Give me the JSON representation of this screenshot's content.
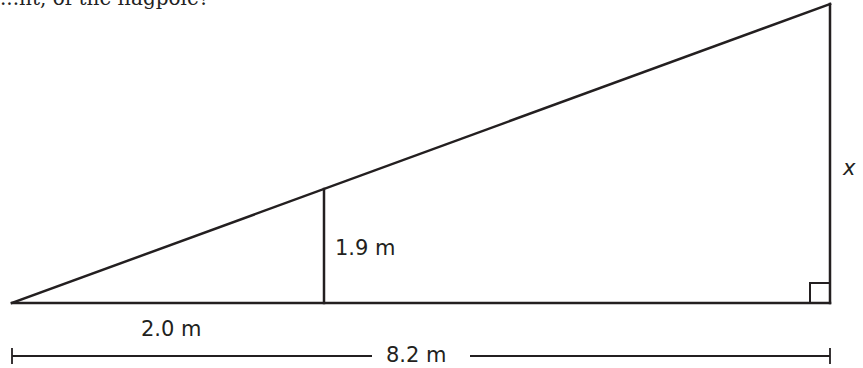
{
  "figure": {
    "cropped_top_text": "...ht, of the flagpole?",
    "labels": {
      "x": "x",
      "inner_height": "1.9 m",
      "inner_base": "2.0 m",
      "total_base": "8.2 m"
    },
    "colors": {
      "line": "#231f20",
      "background": "#ffffff"
    }
  }
}
